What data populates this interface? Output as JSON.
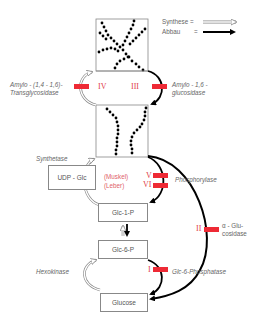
{
  "legend": {
    "synthesis_label": "Synthese =",
    "degradation_label": "Abbau",
    "degradation_eq": "=",
    "synthesis_style": "hollow-arrow",
    "degradation_style": "solid-black-arrow"
  },
  "nodes": {
    "glycogen_branched": "",
    "glycogen_chain": "",
    "udp_glc": "UDP - Glc",
    "glc1p": "Glc-1-P",
    "glc6p": "Glc-6-P",
    "glucose": "Glucose"
  },
  "enzymes": {
    "transglycosidase_line1": "Amylo - (1,4 - 1,6)-",
    "transglycosidase_line2": "Transglycosidase",
    "glucosidase16_line1": "Amylo - 1,6 -",
    "glucosidase16_line2": "glucosidase",
    "synthetase": "Synthetase",
    "phosphorylase": "Phosphorylase",
    "alpha_glucosidase_line1": "α - Glu-",
    "alpha_glucosidase_line2": "cosidase",
    "hexokinase": "Hexokinase",
    "glc6phosphatase": "Glc-6-Phosphatase"
  },
  "defect_types": {
    "IV": "IV",
    "III": "III",
    "V": "V",
    "VI": "VI",
    "II": "II",
    "I": "I",
    "muskel": "(Muskel)",
    "leber": "(Leber)"
  },
  "colors": {
    "block": "#ee2a35",
    "roman": "#e0404a",
    "arrow": "#000000",
    "box_border": "#888888",
    "text": "#666666"
  }
}
